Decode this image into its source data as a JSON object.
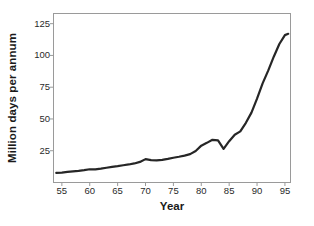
{
  "chart_data": {
    "type": "line",
    "title": "",
    "xlabel": "Year",
    "ylabel": "Million days per annum",
    "xlim": [
      53.5,
      96
    ],
    "ylim": [
      0,
      133
    ],
    "grid": false,
    "legend": null,
    "x_ticks": [
      55,
      60,
      65,
      70,
      75,
      80,
      85,
      90,
      95
    ],
    "x_tick_labels": [
      "55",
      "60",
      "65",
      "70",
      "75",
      "80",
      "85",
      "90",
      "95"
    ],
    "y_ticks": [
      25,
      50,
      75,
      100,
      125
    ],
    "y_tick_labels": [
      "25",
      "50",
      "75",
      "100",
      "125"
    ],
    "line_color": "#262626",
    "line_width": 2.2,
    "axis_color": "#9a9a9a",
    "background": "#ffffff",
    "series": [
      {
        "name": "Million days per annum",
        "x": [
          54,
          55,
          56,
          57,
          58,
          59,
          60,
          61,
          62,
          63,
          64,
          65,
          66,
          67,
          68,
          69,
          70,
          71,
          72,
          73,
          74,
          75,
          76,
          77,
          78,
          79,
          80,
          81,
          82,
          83,
          84,
          85,
          86,
          87,
          88,
          89,
          90,
          91,
          92,
          93,
          94,
          95,
          95.6
        ],
        "values": [
          7.5,
          7.8,
          8.3,
          8.8,
          9.2,
          9.7,
          10.4,
          10.3,
          10.9,
          11.6,
          12.3,
          12.9,
          13.6,
          14.2,
          15.0,
          16.2,
          18.4,
          17.6,
          17.4,
          17.8,
          18.6,
          19.5,
          20.3,
          21.2,
          22.3,
          24.8,
          29.0,
          31.2,
          33.6,
          33.2,
          26.4,
          32.5,
          37.6,
          40.2,
          47.0,
          55.0,
          66.0,
          78.0,
          88.0,
          99.0,
          109.0,
          116.0,
          117.0
        ]
      }
    ]
  }
}
